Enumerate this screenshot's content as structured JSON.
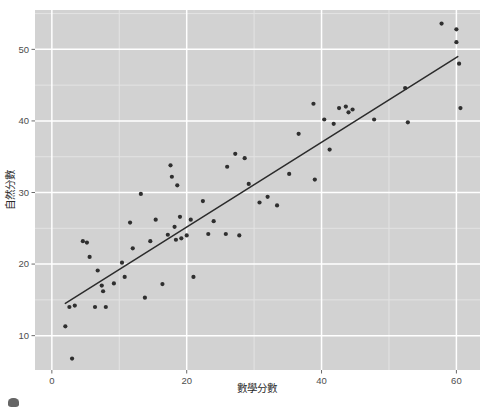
{
  "chart_data": {
    "type": "scatter",
    "title": "",
    "subtitle": "",
    "xlabel": "數學分數",
    "ylabel": "自然分數",
    "xlim": [
      -2.5,
      63.5
    ],
    "ylim": [
      5.2,
      55.5
    ],
    "xticks": [
      0,
      20,
      40,
      60
    ],
    "xtick_labels": [
      "0",
      "20",
      "40",
      "60"
    ],
    "yticks": [
      10,
      20,
      30,
      40,
      50
    ],
    "ytick_labels": [
      "10",
      "20",
      "30",
      "40",
      "50"
    ],
    "grid": true,
    "grid_major_color": "#ffffff",
    "grid_minor_color": "#e3e3e3",
    "panel_background": "#d2d2d2",
    "point_color": "#2f2f2f",
    "point_size": 2.1,
    "legend": "none",
    "legend_position": "none",
    "series": [
      {
        "name": "students",
        "type": "scatter",
        "points": [
          [
            2.0,
            11.3
          ],
          [
            2.6,
            14.0
          ],
          [
            3.0,
            6.8
          ],
          [
            3.4,
            14.2
          ],
          [
            4.6,
            23.2
          ],
          [
            5.2,
            23.0
          ],
          [
            5.6,
            21.0
          ],
          [
            6.4,
            14.0
          ],
          [
            6.8,
            19.1
          ],
          [
            7.4,
            17.0
          ],
          [
            7.6,
            16.2
          ],
          [
            8.0,
            14.0
          ],
          [
            9.2,
            17.3
          ],
          [
            10.4,
            20.2
          ],
          [
            10.8,
            18.2
          ],
          [
            11.6,
            25.8
          ],
          [
            12.0,
            22.2
          ],
          [
            13.2,
            29.8
          ],
          [
            13.8,
            15.3
          ],
          [
            14.6,
            23.2
          ],
          [
            15.4,
            26.2
          ],
          [
            16.4,
            17.2
          ],
          [
            17.2,
            24.1
          ],
          [
            17.6,
            33.8
          ],
          [
            17.8,
            32.2
          ],
          [
            18.2,
            25.2
          ],
          [
            18.4,
            23.4
          ],
          [
            18.6,
            31.0
          ],
          [
            19.0,
            26.6
          ],
          [
            19.2,
            23.6
          ],
          [
            20.0,
            24.0
          ],
          [
            20.6,
            26.2
          ],
          [
            21.0,
            18.2
          ],
          [
            22.4,
            28.8
          ],
          [
            23.2,
            24.2
          ],
          [
            24.0,
            26.0
          ],
          [
            25.8,
            24.2
          ],
          [
            26.0,
            33.6
          ],
          [
            27.2,
            35.4
          ],
          [
            27.8,
            24.0
          ],
          [
            28.6,
            34.8
          ],
          [
            29.2,
            31.2
          ],
          [
            30.8,
            28.6
          ],
          [
            32.0,
            29.4
          ],
          [
            33.4,
            28.2
          ],
          [
            35.2,
            32.6
          ],
          [
            36.6,
            38.2
          ],
          [
            38.8,
            42.4
          ],
          [
            39.0,
            31.8
          ],
          [
            40.4,
            40.2
          ],
          [
            41.2,
            36.0
          ],
          [
            41.8,
            39.6
          ],
          [
            42.6,
            41.8
          ],
          [
            43.6,
            42.0
          ],
          [
            44.0,
            41.2
          ],
          [
            44.6,
            41.6
          ],
          [
            47.8,
            40.2
          ],
          [
            52.4,
            44.6
          ],
          [
            52.8,
            39.8
          ],
          [
            57.8,
            53.6
          ],
          [
            60.0,
            52.8
          ],
          [
            60.0,
            51.0
          ],
          [
            60.4,
            48.0
          ],
          [
            60.6,
            41.8
          ]
        ]
      },
      {
        "name": "regression-line",
        "type": "line",
        "color": "#2b2b2b",
        "width": 1.5,
        "points": [
          [
            2.0,
            14.5
          ],
          [
            60.2,
            49.0
          ]
        ]
      }
    ]
  },
  "axes": {
    "x_title": "數學分數",
    "y_title": "自然分數"
  },
  "artifacts": {
    "cursor_label": "cursor"
  }
}
